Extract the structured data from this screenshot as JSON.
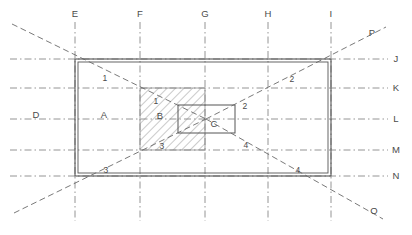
{
  "diagram": {
    "type": "engineering-projection-grid",
    "colors": {
      "line": "#555555",
      "grid": "#777777",
      "hatch": "#888888",
      "text": "#4a4a4a",
      "background": "#ffffff"
    },
    "outer_rect": {
      "x1": 75,
      "y1": 59,
      "x2": 331,
      "y2": 176
    },
    "hatch_rect": {
      "x1": 140,
      "y1": 88,
      "x2": 205,
      "y2": 150
    },
    "inner_rect": {
      "x1": 178,
      "y1": 105,
      "x2": 235,
      "y2": 133
    },
    "column_labels": [
      {
        "id": "col-E",
        "text": "E",
        "x": 75
      },
      {
        "id": "col-F",
        "text": "F",
        "x": 140
      },
      {
        "id": "col-G",
        "text": "G",
        "x": 205
      },
      {
        "id": "col-H",
        "text": "H",
        "x": 268
      },
      {
        "id": "col-I",
        "text": "I",
        "x": 331
      }
    ],
    "row_labels": [
      {
        "id": "row-J",
        "text": "J",
        "y": 59
      },
      {
        "id": "row-K",
        "text": "K",
        "y": 88
      },
      {
        "id": "row-L",
        "text": "L",
        "y": 119
      },
      {
        "id": "row-M",
        "text": "M",
        "y": 150
      },
      {
        "id": "row-N",
        "text": "N",
        "y": 176
      }
    ],
    "diagonal_endpoint_labels": [
      {
        "id": "endpoint-P",
        "text": "P",
        "x": 372,
        "y": 36
      },
      {
        "id": "endpoint-O",
        "text": "O",
        "x": 374,
        "y": 211
      }
    ],
    "zone_labels": [
      {
        "id": "zone-A",
        "text": "A",
        "x": 104,
        "y": 115
      },
      {
        "id": "zone-B",
        "text": "B",
        "x": 160,
        "y": 116
      },
      {
        "id": "zone-C",
        "text": "C",
        "x": 213,
        "y": 124
      },
      {
        "id": "zone-D",
        "text": "D",
        "x": 36,
        "y": 115
      }
    ],
    "diagonal_number_labels": [
      {
        "id": "num-1-outer",
        "text": "1",
        "x": 105,
        "y": 78
      },
      {
        "id": "num-1-inner",
        "text": "1",
        "x": 156,
        "y": 101
      },
      {
        "id": "num-2-inner",
        "text": "2",
        "x": 245,
        "y": 106
      },
      {
        "id": "num-2-outer",
        "text": "2",
        "x": 292,
        "y": 79
      },
      {
        "id": "num-3-inner",
        "text": "3",
        "x": 162,
        "y": 146
      },
      {
        "id": "num-3-outer",
        "text": "3",
        "x": 106,
        "y": 170
      },
      {
        "id": "num-4-inner",
        "text": "4",
        "x": 246,
        "y": 145
      },
      {
        "id": "num-4-outer",
        "text": "4",
        "x": 298,
        "y": 170
      }
    ]
  }
}
